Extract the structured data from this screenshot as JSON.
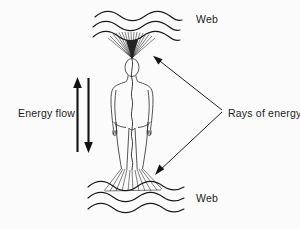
{
  "figure": {
    "background_color": "#fbfbfb",
    "ink_color": "#1a1a1a",
    "labels": {
      "web_top": "Web",
      "web_bottom": "Web",
      "energy_flow": "Energy flow",
      "rays_of_energy": "Rays of energy"
    },
    "elements": {
      "top_web_waves": 3,
      "bottom_web_waves": 3,
      "top_rays": 17,
      "bottom_rays": 11,
      "flow_arrows": [
        {
          "name": "upward-energy-arrow",
          "direction": "up"
        },
        {
          "name": "downward-energy-arrow",
          "direction": "down"
        }
      ],
      "pointer_arrows": [
        {
          "name": "pointer-to-top-rays",
          "target": "head"
        },
        {
          "name": "pointer-to-bottom-rays",
          "target": "feet"
        }
      ],
      "figure_outline": "standing human body, front view, with wavy central energy channel"
    }
  }
}
